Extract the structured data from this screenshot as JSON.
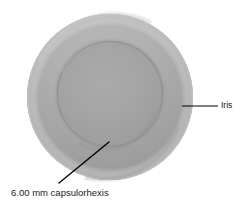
{
  "figure": {
    "type": "medical-illustration",
    "background_color": "#ffffff"
  },
  "structures": {
    "iris": {
      "name": "Iris",
      "shape": "circle",
      "center_x": 110,
      "center_y": 97,
      "radius": 83,
      "fill_color": "#a9a9a9",
      "edge_color": "#bdbdbd",
      "highlight_color": "#c6c6c6",
      "shadow_color": "#8f8f8f"
    },
    "capsulorhexis": {
      "name": "6.00 mm capsulorhexis",
      "shape": "circle",
      "center_x": 110,
      "center_y": 94,
      "radius": 53,
      "fill_color": "#a2a2a2",
      "edge_color": "#969696",
      "rim_color": "#b0b0b0"
    }
  },
  "annotations": [
    {
      "id": "iris-annotation",
      "label": "Iris",
      "leader_line": {
        "type": "horizontal",
        "x1": 182,
        "y1": 106,
        "x2": 218,
        "y2": 106,
        "color": "#000000",
        "width": 1.2
      },
      "label_x": 221,
      "label_y": 101,
      "font_size": "8.5px"
    },
    {
      "id": "capsulorhexis-annotation",
      "label": "6.00 mm capsulorhexis",
      "leader_line": {
        "type": "diagonal",
        "x1": 59,
        "y1": 183,
        "x2": 109,
        "y2": 142,
        "color": "#000000",
        "width": 1.4
      },
      "label_x": 11,
      "label_y": 188,
      "font_size": "9.5px"
    }
  ],
  "measurements": {
    "capsulorhexis_diameter": "6.00 mm"
  },
  "colors": {
    "stroke": "#000000",
    "text": "#1a1a1a",
    "background": "#ffffff"
  }
}
